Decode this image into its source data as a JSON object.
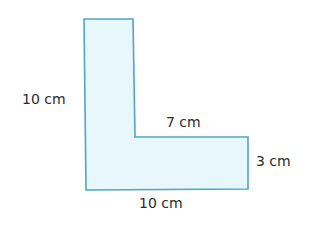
{
  "shape": {
    "type": "L-shape",
    "fill": "#e8f7fb",
    "stroke": "#4fa6c2",
    "points": [
      [
        84,
        19
      ],
      [
        133,
        19
      ],
      [
        135,
        137
      ],
      [
        248,
        137
      ],
      [
        248,
        189
      ],
      [
        86,
        190
      ]
    ]
  },
  "labels": {
    "left_height": "10 cm",
    "inner_top": "7 cm",
    "right_height": "3 cm",
    "bottom_width": "10 cm"
  }
}
